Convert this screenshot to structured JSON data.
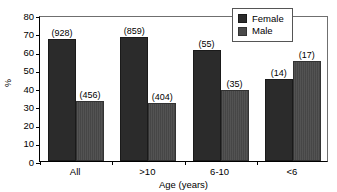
{
  "chart_data": {
    "type": "bar",
    "title": "",
    "xlabel": "Age (years)",
    "ylabel": "%",
    "categories": [
      "All",
      ">10",
      "6-10",
      "<6"
    ],
    "ylim": [
      0,
      80
    ],
    "yticks": [
      0,
      10,
      20,
      30,
      40,
      50,
      60,
      70,
      80
    ],
    "ytick_labels": [
      "0",
      "10",
      "20",
      "30",
      "40",
      "50",
      "60",
      "70",
      "80"
    ],
    "grid": false,
    "legend_position": "top-right",
    "series": [
      {
        "name": "Female",
        "color": "#2b2b2b",
        "values": [
          67,
          68,
          61,
          45
        ],
        "point_labels": [
          "(928)",
          "(859)",
          "(55)",
          "(14)"
        ]
      },
      {
        "name": "Male",
        "color": "#4a4a4a",
        "values": [
          33,
          32,
          39,
          55
        ],
        "point_labels": [
          "(456)",
          "(404)",
          "(35)",
          "(17)"
        ]
      }
    ]
  },
  "legend": {
    "items": [
      {
        "label": "Female",
        "color": "#2b2b2b"
      },
      {
        "label": "Male",
        "color": "#4a4a4a"
      }
    ]
  }
}
